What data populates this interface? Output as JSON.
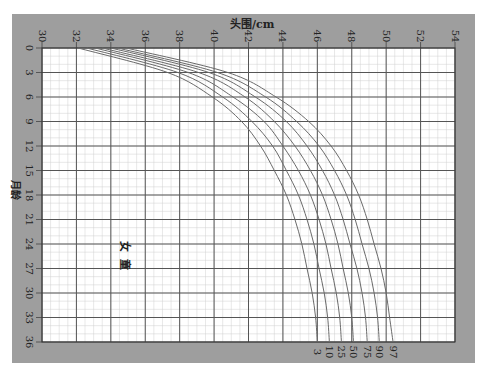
{
  "chart_data": {
    "type": "line",
    "title": "头围/cm",
    "xlabel": "头围/cm",
    "ylabel": "月龄",
    "annotation": "女 童",
    "orientation": "rotated: x = head circumference (cm, top axis), y = age in months (downward)",
    "x_range": [
      30,
      54
    ],
    "y_range": [
      0,
      36
    ],
    "x_ticks": [
      30,
      32,
      34,
      36,
      38,
      40,
      42,
      44,
      46,
      48,
      50,
      52,
      54
    ],
    "y_ticks": [
      0,
      3,
      6,
      9,
      12,
      15,
      18,
      21,
      24,
      27,
      30,
      33,
      36
    ],
    "grid": true,
    "months": [
      0,
      3,
      6,
      9,
      12,
      15,
      18,
      21,
      24,
      27,
      30,
      33,
      36
    ],
    "series": [
      {
        "name": "3",
        "values": [
          32.1,
          37.3,
          39.9,
          41.6,
          42.7,
          43.5,
          44.2,
          44.7,
          45.1,
          45.4,
          45.7,
          45.9,
          46.0
        ]
      },
      {
        "name": "10",
        "values": [
          32.6,
          37.9,
          40.5,
          42.2,
          43.4,
          44.2,
          44.9,
          45.4,
          45.8,
          46.1,
          46.4,
          46.6,
          46.7
        ]
      },
      {
        "name": "25",
        "values": [
          33.1,
          38.5,
          41.1,
          42.9,
          44.0,
          44.9,
          45.6,
          46.1,
          46.5,
          46.8,
          47.1,
          47.3,
          47.4
        ]
      },
      {
        "name": "50",
        "values": [
          33.5,
          39.1,
          41.8,
          43.5,
          44.7,
          45.6,
          46.3,
          46.8,
          47.2,
          47.5,
          47.8,
          48.0,
          48.1
        ]
      },
      {
        "name": "75",
        "values": [
          34.0,
          39.7,
          42.4,
          44.2,
          45.4,
          46.3,
          47.0,
          47.5,
          47.9,
          48.3,
          48.6,
          48.8,
          48.9
        ]
      },
      {
        "name": "90",
        "values": [
          34.4,
          40.2,
          43.0,
          44.8,
          46.1,
          47.0,
          47.7,
          48.2,
          48.6,
          49.0,
          49.3,
          49.5,
          49.6
        ]
      },
      {
        "name": "97",
        "values": [
          34.9,
          40.8,
          43.6,
          45.5,
          46.8,
          47.7,
          48.4,
          48.9,
          49.3,
          49.7,
          50.0,
          50.2,
          50.4
        ]
      }
    ],
    "legend": [
      "3",
      "10",
      "25",
      "50",
      "75",
      "90",
      "97"
    ],
    "legend_position": "curve end labels below plot at 36 months"
  },
  "colors": {
    "frame": "#9e9e9e",
    "plot_bg": "#ffffff",
    "major_grid": "#555555",
    "minor_grid": "#d0d0d0",
    "curve": "#6a6a6a",
    "text": "#222222"
  }
}
